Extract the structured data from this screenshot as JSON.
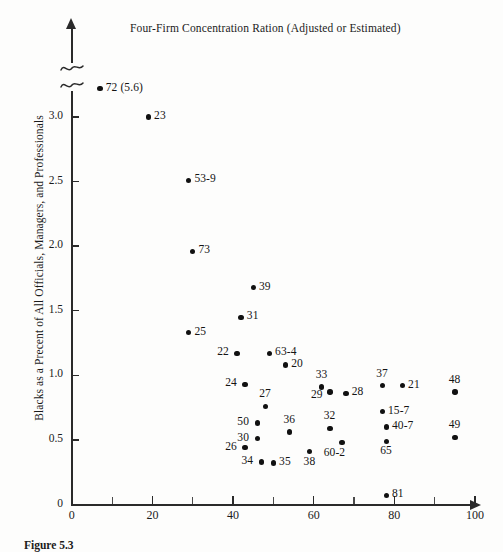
{
  "figure": {
    "title": "Four-Firm Concentration Ration (Adjusted or Estimated)",
    "y_axis_title": "Blacks as a Precent of All Officials, Managers, and Professionals",
    "x_axis_title": "",
    "caption": "Figure 5.3",
    "axis_break_symbol": "~"
  },
  "chart_data": {
    "type": "scatter",
    "title": "Four-Firm Concentration Ration (Adjusted or Estimated)",
    "xlabel": "Four-Firm Concentration Ration (Adjusted or Estimated)",
    "ylabel": "Blacks as a Precent of All Officials, Managers, and Professionals",
    "xlim": [
      0,
      100
    ],
    "ylim": [
      0,
      3.25
    ],
    "grid": false,
    "legend": null,
    "axis_break": {
      "axis": "y",
      "note": "y-axis broken above 3.0; topmost point plotted off-scale with true value shown in parentheses"
    },
    "xticks": [
      0,
      20,
      40,
      60,
      80,
      100
    ],
    "xtick_labels": [
      "0",
      "20",
      "40",
      "60",
      "80",
      "100"
    ],
    "x_minor_ticks": [
      10,
      30,
      50,
      70,
      90
    ],
    "yticks": [
      0,
      0.5,
      1.0,
      1.5,
      2.0,
      2.5,
      3.0
    ],
    "ytick_labels": [
      "0",
      "0.5",
      "1.0",
      "1.5",
      "2.0",
      "2.5",
      "3.0"
    ],
    "points": [
      {
        "label": "72 (5.6)",
        "x": 7,
        "y": 3.22,
        "pos": "right",
        "note": "plotted above axis break; true y = 5.6"
      },
      {
        "label": "23",
        "x": 19,
        "y": 3.0,
        "pos": "right"
      },
      {
        "label": "53-9",
        "x": 29,
        "y": 2.51,
        "pos": "right"
      },
      {
        "label": "73",
        "x": 30,
        "y": 1.96,
        "pos": "right"
      },
      {
        "label": "39",
        "x": 45,
        "y": 1.68,
        "pos": "right"
      },
      {
        "label": "31",
        "x": 42,
        "y": 1.45,
        "pos": "right"
      },
      {
        "label": "25",
        "x": 29,
        "y": 1.33,
        "pos": "right"
      },
      {
        "label": "22",
        "x": 41,
        "y": 1.17,
        "pos": "left"
      },
      {
        "label": "63-4",
        "x": 49,
        "y": 1.17,
        "pos": "right"
      },
      {
        "label": "20",
        "x": 53,
        "y": 1.08,
        "pos": "right"
      },
      {
        "label": "24",
        "x": 43,
        "y": 0.93,
        "pos": "left"
      },
      {
        "label": "33",
        "x": 62,
        "y": 0.91,
        "pos": "above"
      },
      {
        "label": "29",
        "x": 64,
        "y": 0.87,
        "pos": "above-left"
      },
      {
        "label": "28",
        "x": 68,
        "y": 0.86,
        "pos": "right"
      },
      {
        "label": "37",
        "x": 77,
        "y": 0.92,
        "pos": "above"
      },
      {
        "label": "21",
        "x": 82,
        "y": 0.92,
        "pos": "right"
      },
      {
        "label": "48",
        "x": 95,
        "y": 0.87,
        "pos": "above"
      },
      {
        "label": "27",
        "x": 48,
        "y": 0.76,
        "pos": "above"
      },
      {
        "label": "15-7",
        "x": 77,
        "y": 0.72,
        "pos": "right"
      },
      {
        "label": "50",
        "x": 46,
        "y": 0.63,
        "pos": "left"
      },
      {
        "label": "36",
        "x": 54,
        "y": 0.56,
        "pos": "above"
      },
      {
        "label": "32",
        "x": 64,
        "y": 0.59,
        "pos": "above"
      },
      {
        "label": "40-7",
        "x": 78,
        "y": 0.6,
        "pos": "right"
      },
      {
        "label": "49",
        "x": 95,
        "y": 0.52,
        "pos": "above"
      },
      {
        "label": "30",
        "x": 46,
        "y": 0.51,
        "pos": "left"
      },
      {
        "label": "26",
        "x": 43,
        "y": 0.44,
        "pos": "left"
      },
      {
        "label": "60-2",
        "x": 67,
        "y": 0.48,
        "pos": "below-right"
      },
      {
        "label": "65",
        "x": 78,
        "y": 0.49,
        "pos": "below"
      },
      {
        "label": "38",
        "x": 59,
        "y": 0.41,
        "pos": "below"
      },
      {
        "label": "34",
        "x": 47,
        "y": 0.33,
        "pos": "left"
      },
      {
        "label": "35",
        "x": 50,
        "y": 0.32,
        "pos": "right"
      },
      {
        "label": "81",
        "x": 78,
        "y": 0.07,
        "pos": "right"
      }
    ]
  }
}
